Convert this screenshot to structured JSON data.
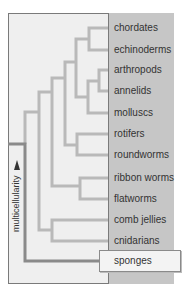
{
  "diagram": {
    "type": "cladogram",
    "axis_label": "multicellularity",
    "taxa": [
      {
        "name": "chordates",
        "y": 22
      },
      {
        "name": "echinoderms",
        "y": 44
      },
      {
        "name": "arthropods",
        "y": 64
      },
      {
        "name": "annelids",
        "y": 85
      },
      {
        "name": "molluscs",
        "y": 107
      },
      {
        "name": "rotifers",
        "y": 128
      },
      {
        "name": "roundworms",
        "y": 149
      },
      {
        "name": "ribbon worms",
        "y": 172
      },
      {
        "name": "flatworms",
        "y": 193
      },
      {
        "name": "comb jellies",
        "y": 214
      },
      {
        "name": "cnidarians",
        "y": 235
      }
    ],
    "highlighted_taxon": "sponges",
    "colors": {
      "background": "#efefef",
      "panel": "#c6c6c6",
      "branch": "#b9b9b9",
      "trunk": "#8a8a8a",
      "frame": "#7a7a7a",
      "text": "#333333"
    }
  }
}
